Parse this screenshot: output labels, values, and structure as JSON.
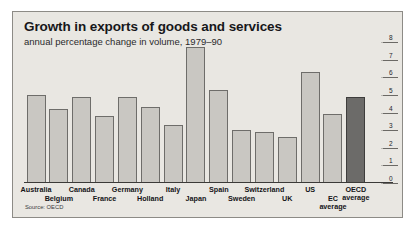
{
  "chart_data": {
    "type": "bar",
    "title": "Growth in exports of goods and services",
    "subtitle": "annual percentage change in volume, 1979–90",
    "source": "Source: OECD",
    "xlabel": "",
    "ylabel": "",
    "ylim": [
      0,
      8
    ],
    "yticks": [
      0,
      1,
      2,
      3,
      4,
      5,
      6,
      7,
      8
    ],
    "ytick_labels": [
      "0",
      "1",
      "2",
      "3",
      "4",
      "5",
      "6",
      "7",
      "8"
    ],
    "axis_position": "right",
    "grid": false,
    "legend": "none",
    "categories": [
      "Australia",
      "Belgium",
      "Canada",
      "France",
      "Germany",
      "Holland",
      "Italy",
      "Japan",
      "Spain",
      "Sweden",
      "Switzerland",
      "UK",
      "US",
      "EC average",
      "OECD average"
    ],
    "values": [
      5.0,
      4.2,
      4.9,
      3.8,
      4.9,
      4.3,
      3.3,
      7.7,
      5.3,
      3.0,
      2.9,
      2.6,
      6.3,
      3.9,
      4.9
    ],
    "bar_colors": [
      "#c9c7c2",
      "#c9c7c2",
      "#c9c7c2",
      "#c9c7c2",
      "#c9c7c2",
      "#c9c7c2",
      "#c9c7c2",
      "#c9c7c2",
      "#c9c7c2",
      "#c9c7c2",
      "#c9c7c2",
      "#c9c7c2",
      "#c9c7c2",
      "#c9c7c2",
      "#6c6b69"
    ],
    "highlight_category": "OECD average",
    "label_rows": [
      0,
      1,
      0,
      1,
      0,
      1,
      0,
      1,
      0,
      1,
      0,
      1,
      0,
      1,
      0
    ]
  },
  "colors": {
    "panel_background": "#e9e7e2",
    "panel_border": "#8d8b86",
    "bar_fill": "#c9c7c2",
    "bar_stroke": "#6e6d6a",
    "bar_highlight_fill": "#6c6b69",
    "text": "#17171a",
    "axis": "#3b3a38"
  }
}
